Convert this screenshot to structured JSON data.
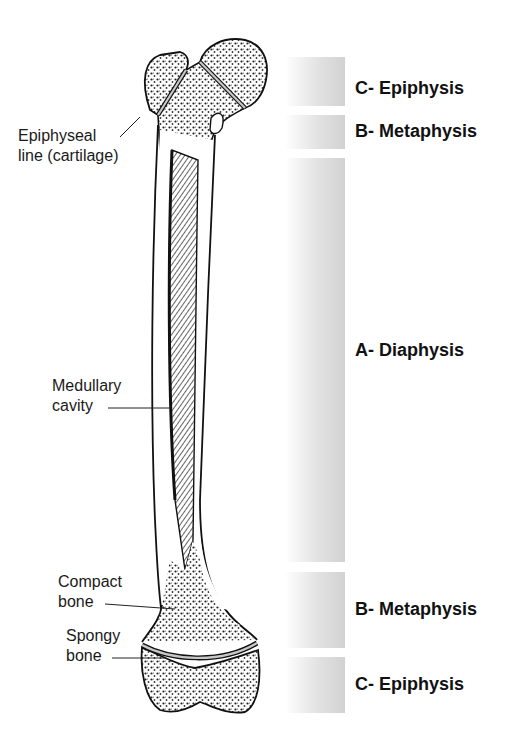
{
  "figure": {
    "callouts": [
      {
        "id": "epiphyseal-line",
        "line1": "Epiphyseal",
        "line2": "line (cartilage)"
      },
      {
        "id": "medullary-cavity",
        "line1": "Medullary",
        "line2": "cavity"
      },
      {
        "id": "compact-bone",
        "line1": "Compact",
        "line2": "bone"
      },
      {
        "id": "spongy-bone",
        "line1": "Spongy",
        "line2": "bone"
      }
    ],
    "regions": [
      {
        "label": "C- Epiphysis",
        "top": 57,
        "height": 49,
        "label_y": 78
      },
      {
        "label": "B- Metaphysis",
        "top": 115,
        "height": 34,
        "label_y": 121
      },
      {
        "label": "A- Diaphysis",
        "top": 158,
        "height": 404,
        "label_y": 340
      },
      {
        "label": "B- Metaphysis",
        "top": 572,
        "height": 76,
        "label_y": 599
      },
      {
        "label": "C- Epiphysis",
        "top": 657,
        "height": 56,
        "label_y": 674
      }
    ],
    "colors": {
      "outline": "#111111",
      "region_bar": "#d2d2d2",
      "cartilage_line": "#c8c8c8"
    }
  }
}
